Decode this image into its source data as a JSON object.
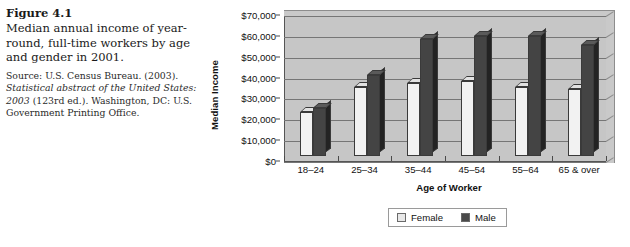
{
  "figure": {
    "number": "Figure 4.1",
    "caption": "Median annual income of year-round, full-time workers by age and gender in 2001.",
    "source_prefix": "Source: U.S. Census Bureau. (2003). ",
    "source_italic_1": "Statistical abstract of the United States: 2003",
    "source_mid": " (123rd ed.). Washington, DC: U.S. Government Printing Office."
  },
  "legend": {
    "female_label": "Female",
    "male_label": "Male"
  },
  "colors": {
    "female_bar": "#f2f2f2",
    "male_bar": "#444444",
    "plot_background": "#c6c6c6",
    "gridline": "#767676",
    "text": "#111111"
  },
  "chart_data": {
    "type": "bar",
    "title": "",
    "xlabel": "Age of Worker",
    "ylabel": "Median Income",
    "categories": [
      "18–24",
      "25–34",
      "35–44",
      "45–54",
      "55–64",
      "65 & over"
    ],
    "series": [
      {
        "name": "Female",
        "values": [
          21000,
          33000,
          35000,
          36000,
          33000,
          32000
        ]
      },
      {
        "name": "Male",
        "values": [
          23000,
          39000,
          56000,
          57500,
          57500,
          53000
        ]
      }
    ],
    "ylim": [
      0,
      70000
    ],
    "ytick_values": [
      0,
      10000,
      20000,
      30000,
      40000,
      50000,
      60000,
      70000
    ],
    "ytick_labels": [
      "$0",
      "$10,000",
      "$20,000",
      "$30,000",
      "$40,000",
      "$50,000",
      "$60,000",
      "$70,000"
    ],
    "grid": true,
    "legend_position": "bottom",
    "style": "3d-column"
  }
}
